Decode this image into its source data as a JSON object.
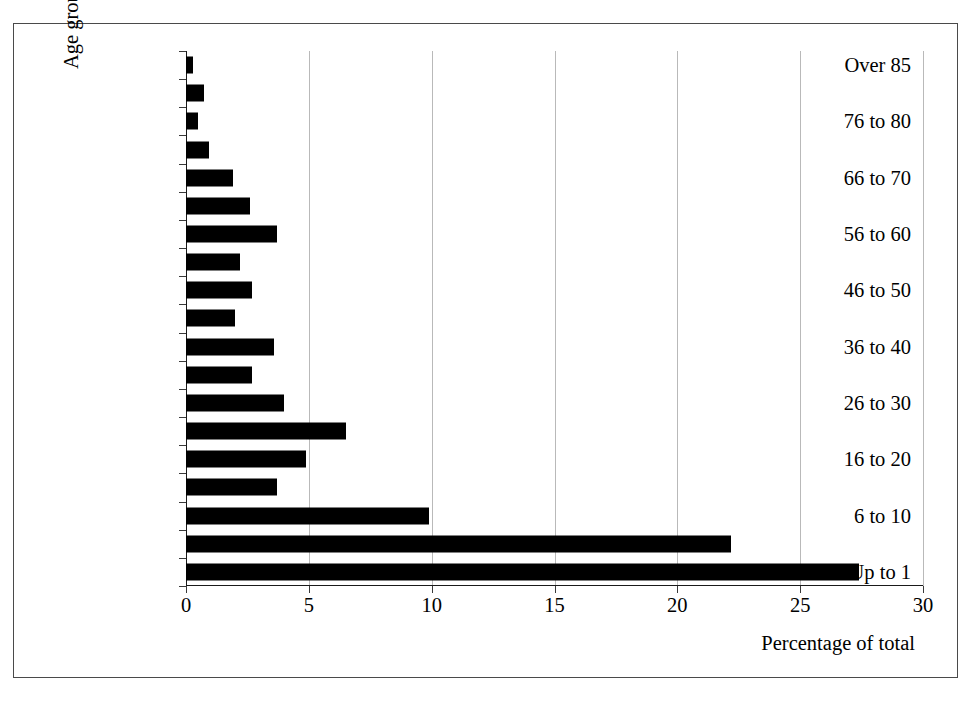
{
  "chart_data": {
    "type": "bar",
    "orientation": "horizontal",
    "title": "",
    "xlabel": "Percentage of total",
    "ylabel": "Age group (years old)",
    "xlim": [
      0,
      30
    ],
    "xticks": [
      0,
      5,
      10,
      15,
      20,
      25,
      30
    ],
    "xtick_labels": [
      "0",
      "5",
      "10",
      "15",
      "20",
      "25",
      "30"
    ],
    "grid": "vertical",
    "legend": "none",
    "bar_color": "#000000",
    "categories": [
      "Over 85",
      "81 to 85",
      "76 to 80",
      "71 to 75",
      "66 to 70",
      "61 to 65",
      "56 to 60",
      "51 to 55",
      "46 to 50",
      "41 to 45",
      "36 to 40",
      "31 to 35",
      "26 to 30",
      "21 to 25",
      "16 to 20",
      "11 to 15",
      "6 to 10",
      "1 to 5",
      "Up to 1"
    ],
    "visible_tick_labels": [
      "Over 85",
      "",
      "76 to 80",
      "",
      "66 to 70",
      "",
      "56 to 60",
      "",
      "46 to 50",
      "",
      "36 to 40",
      "",
      "26 to 30",
      "",
      "16 to 20",
      "",
      "6 to 10",
      "",
      "Up to 1"
    ],
    "values": [
      0.3,
      0.75,
      0.5,
      0.95,
      1.9,
      2.6,
      3.7,
      2.2,
      2.7,
      2.0,
      3.6,
      2.7,
      4.0,
      6.5,
      4.9,
      3.7,
      9.9,
      22.2,
      27.4
    ]
  }
}
